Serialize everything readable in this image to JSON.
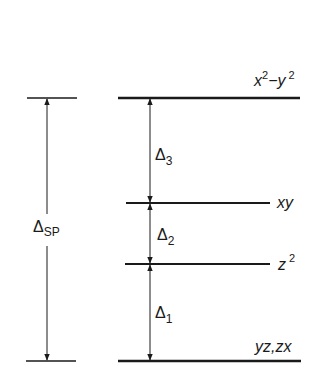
{
  "diagram": {
    "type": "energy-level-diagram",
    "colors": {
      "line": "#1a1a1a",
      "background": "#ffffff"
    },
    "levels": [
      {
        "id": "x2-y2",
        "label_main": "x",
        "label_sup1": "2",
        "label_mid": "−y",
        "label_sup2": "2",
        "y": 98
      },
      {
        "id": "xy",
        "label": "xy",
        "y": 203
      },
      {
        "id": "z2",
        "label_main": "z",
        "label_sup": "2",
        "y": 264
      },
      {
        "id": "yz-zx",
        "label": "yz,zx",
        "y": 361
      }
    ],
    "gaps": [
      {
        "id": "delta3",
        "symbol": "Δ",
        "sub": "3",
        "from": "xy",
        "to": "x2-y2"
      },
      {
        "id": "delta2",
        "symbol": "Δ",
        "sub": "2",
        "from": "z2",
        "to": "xy"
      },
      {
        "id": "delta1",
        "symbol": "Δ",
        "sub": "1",
        "from": "yz-zx",
        "to": "z2"
      }
    ],
    "total_gap": {
      "id": "delta-sp",
      "symbol": "Δ",
      "sub": "SP",
      "from": "yz-zx",
      "to": "x2-y2"
    }
  }
}
